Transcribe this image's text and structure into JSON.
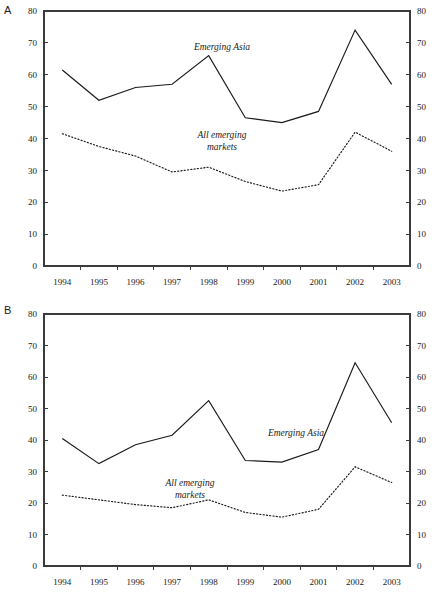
{
  "figure": {
    "panels": [
      {
        "letter": "A",
        "annotations": [
          {
            "name": "emerging-asia-label",
            "lines": [
              "Emerging Asia"
            ]
          },
          {
            "name": "all-emerging-markets-label",
            "lines": [
              "All emerging",
              "markets"
            ]
          }
        ]
      },
      {
        "letter": "B",
        "annotations": [
          {
            "name": "emerging-asia-label",
            "lines": [
              "Emerging Asia"
            ]
          },
          {
            "name": "all-emerging-markets-label",
            "lines": [
              "All emerging",
              "markets"
            ]
          }
        ]
      }
    ]
  },
  "chart_data": [
    {
      "panel": "A",
      "type": "line",
      "title": "",
      "xlabel": "",
      "ylabel": "",
      "x": [
        "1994",
        "1995",
        "1996",
        "1997",
        "1998",
        "1999",
        "2000",
        "2001",
        "2002",
        "2003"
      ],
      "categories": [
        "1994",
        "1995",
        "1996",
        "1997",
        "1998",
        "1999",
        "2000",
        "2001",
        "2002",
        "2003"
      ],
      "ylim": [
        0,
        80
      ],
      "yticks": [
        0,
        10,
        20,
        30,
        40,
        50,
        60,
        70,
        80
      ],
      "ytick_labels": [
        "0",
        "10",
        "20",
        "30",
        "40",
        "50",
        "60",
        "70",
        "80"
      ],
      "right_axis": true,
      "right_ylim": [
        0,
        80
      ],
      "right_yticks": [
        0,
        10,
        20,
        30,
        40,
        50,
        60,
        70,
        80
      ],
      "right_ytick_labels": [
        "0",
        "10",
        "20",
        "30",
        "40",
        "50",
        "60",
        "70",
        "80"
      ],
      "grid": false,
      "legend_position": "inline-annotation",
      "series": [
        {
          "name": "Emerging Asia",
          "style": "solid",
          "color": "#1a1a1a",
          "values": [
            61.5,
            52.0,
            56.0,
            57.0,
            66.0,
            46.5,
            45.0,
            48.5,
            74.0,
            57.0
          ]
        },
        {
          "name": "All emerging markets",
          "style": "dotted",
          "color": "#1a1a1a",
          "values": [
            41.5,
            37.5,
            34.5,
            29.5,
            31.0,
            26.5,
            23.5,
            25.5,
            42.0,
            36.0
          ]
        }
      ]
    },
    {
      "panel": "B",
      "type": "line",
      "title": "",
      "xlabel": "",
      "ylabel": "",
      "x": [
        "1994",
        "1995",
        "1996",
        "1997",
        "1998",
        "1999",
        "2000",
        "2001",
        "2002",
        "2003"
      ],
      "categories": [
        "1994",
        "1995",
        "1996",
        "1997",
        "1998",
        "1999",
        "2000",
        "2001",
        "2002",
        "2003"
      ],
      "ylim": [
        0,
        80
      ],
      "yticks": [
        0,
        10,
        20,
        30,
        40,
        50,
        60,
        70,
        80
      ],
      "ytick_labels": [
        "0",
        "10",
        "20",
        "30",
        "40",
        "50",
        "60",
        "70",
        "80"
      ],
      "right_axis": true,
      "right_ylim": [
        0,
        80
      ],
      "right_yticks": [
        0,
        10,
        20,
        30,
        40,
        50,
        60,
        70,
        80
      ],
      "right_ytick_labels": [
        "0",
        "10",
        "20",
        "30",
        "40",
        "50",
        "60",
        "70",
        "80"
      ],
      "grid": false,
      "legend_position": "inline-annotation",
      "series": [
        {
          "name": "Emerging Asia",
          "style": "solid",
          "color": "#1a1a1a",
          "values": [
            40.5,
            32.5,
            38.5,
            41.5,
            52.5,
            33.5,
            33.0,
            37.0,
            64.5,
            45.5
          ]
        },
        {
          "name": "All emerging markets",
          "style": "dotted",
          "color": "#1a1a1a",
          "values": [
            22.5,
            21.0,
            19.5,
            18.5,
            21.0,
            17.0,
            15.5,
            18.0,
            31.5,
            26.5
          ]
        }
      ]
    }
  ]
}
